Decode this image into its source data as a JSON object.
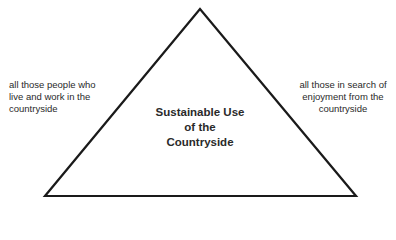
{
  "diagram": {
    "center": {
      "lines": [
        "Sustainable Use",
        "of the",
        "Countryside"
      ]
    },
    "left_label": {
      "lines": [
        "all those people who",
        "live and work in the",
        "countryside"
      ]
    },
    "right_label": {
      "lines": [
        "all those in search of",
        "enjoyment from the",
        "countryside"
      ]
    },
    "colors": {
      "stroke": "#1a1a1a",
      "text": "#2a2a2a",
      "background": "#ffffff"
    }
  }
}
